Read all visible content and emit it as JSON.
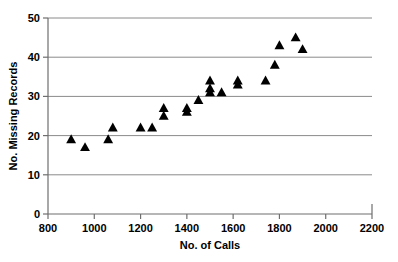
{
  "chart_data": {
    "type": "scatter",
    "title": "",
    "xlabel": "No. of Calls",
    "ylabel": "No. Missing Records",
    "xlim": [
      800,
      2200
    ],
    "ylim": [
      0,
      50
    ],
    "xticks": [
      800,
      1000,
      1200,
      1400,
      1600,
      1800,
      2000,
      2200
    ],
    "yticks": [
      0,
      10,
      20,
      30,
      40,
      50
    ],
    "xtick_labels": [
      "800",
      "1000",
      "1200",
      "1400",
      "1600",
      "1800",
      "2000",
      "2200"
    ],
    "ytick_labels": [
      "0",
      "10",
      "20",
      "30",
      "40",
      "50"
    ],
    "grid": "horizontal",
    "legend": "none",
    "marker": "triangle-up",
    "marker_color": "#000000",
    "points": [
      {
        "x": 900,
        "y": 19
      },
      {
        "x": 960,
        "y": 17
      },
      {
        "x": 1060,
        "y": 19
      },
      {
        "x": 1080,
        "y": 22
      },
      {
        "x": 1200,
        "y": 22
      },
      {
        "x": 1250,
        "y": 22
      },
      {
        "x": 1300,
        "y": 25
      },
      {
        "x": 1300,
        "y": 27
      },
      {
        "x": 1400,
        "y": 26
      },
      {
        "x": 1400,
        "y": 27
      },
      {
        "x": 1450,
        "y": 29
      },
      {
        "x": 1500,
        "y": 31
      },
      {
        "x": 1500,
        "y": 32
      },
      {
        "x": 1500,
        "y": 34
      },
      {
        "x": 1550,
        "y": 31
      },
      {
        "x": 1620,
        "y": 33
      },
      {
        "x": 1620,
        "y": 34
      },
      {
        "x": 1740,
        "y": 34
      },
      {
        "x": 1780,
        "y": 38
      },
      {
        "x": 1800,
        "y": 43
      },
      {
        "x": 1870,
        "y": 45
      },
      {
        "x": 1900,
        "y": 42
      }
    ]
  },
  "axes": {
    "x_title": "No. of Calls",
    "y_title": "No. Missing Records"
  }
}
